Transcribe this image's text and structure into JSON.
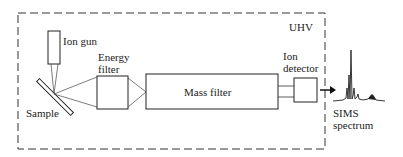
{
  "diagram": {
    "enclosure_label": "UHV",
    "components": {
      "ion_gun": "Ion gun",
      "sample": "Sample",
      "energy_filter_line1": "Energy",
      "energy_filter_line2": "filter",
      "mass_filter": "Mass filter",
      "ion_detector_line1": "Ion",
      "ion_detector_line2": "detector",
      "spectrum_line1": "SIMS",
      "spectrum_line2": "spectrum"
    }
  }
}
